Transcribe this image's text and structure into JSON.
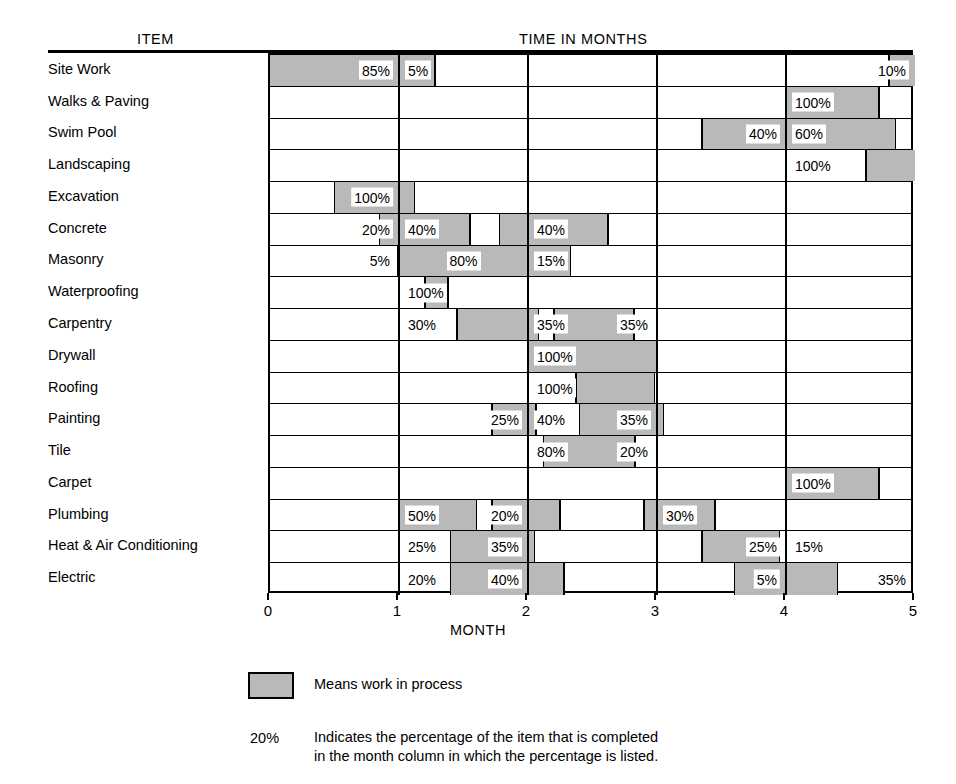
{
  "headers": {
    "item": "ITEM",
    "time": "TIME IN MONTHS",
    "axis_title": "MONTH"
  },
  "legend": {
    "swatch_text": "Means work in process",
    "pct_key": "20%",
    "desc_line1": "Indicates the percentage of the item that is completed",
    "desc_line2": "in the month column in which the percentage is listed."
  },
  "chart_data": {
    "type": "bar",
    "title": "TIME IN MONTHS",
    "subtitle": "Construction Progress Schedule",
    "xlabel": "MONTH",
    "ylabel": "ITEM",
    "xlim": [
      0,
      5
    ],
    "xticks": [
      "0",
      "1",
      "2",
      "3",
      "4",
      "5"
    ],
    "grid": true,
    "legend_position": "below",
    "colors": {
      "work_in_process": "#b9b9b9",
      "idle": "#ffffff",
      "line": "#000000"
    },
    "month_columns": 5,
    "categories": [
      "Site Work",
      "Walks & Paving",
      "Swim Pool",
      "Landscaping",
      "Excavation",
      "Concrete",
      "Masonry",
      "Waterproofing",
      "Carpentry",
      "Drywall",
      "Roofing",
      "Painting",
      "Tile",
      "Carpet",
      "Plumbing",
      "Heat & Air Conditioning",
      "Electric"
    ],
    "rows": [
      {
        "item": "Site Work",
        "bands": [
          [
            0,
            1.28
          ],
          [
            4.8,
            5.0
          ]
        ],
        "labels": [
          {
            "text": "85%",
            "month": 1,
            "align": "right"
          },
          {
            "text": "5%",
            "month": 2,
            "align": "left"
          },
          {
            "text": "10%",
            "month": 5,
            "align": "right"
          }
        ],
        "values": [
          85,
          5,
          0,
          0,
          10
        ]
      },
      {
        "item": "Walks & Paving",
        "bands": [
          [
            4.0,
            4.72
          ]
        ],
        "labels": [
          {
            "text": "100%",
            "month": 5,
            "align": "left"
          }
        ],
        "values": [
          0,
          0,
          0,
          0,
          100
        ]
      },
      {
        "item": "Swim Pool",
        "bands": [
          [
            3.35,
            4.85
          ]
        ],
        "labels": [
          {
            "text": "40%",
            "month": 4,
            "align": "right"
          },
          {
            "text": "60%",
            "month": 5,
            "align": "left"
          }
        ],
        "values": [
          0,
          0,
          0,
          40,
          60
        ]
      },
      {
        "item": "Landscaping",
        "bands": [
          [
            4.62,
            5.0
          ]
        ],
        "labels": [
          {
            "text": "100%",
            "month": 5,
            "align": "left"
          }
        ],
        "values": [
          0,
          0,
          0,
          0,
          100
        ]
      },
      {
        "item": "Excavation",
        "bands": [
          [
            0.5,
            1.12
          ]
        ],
        "labels": [
          {
            "text": "100%",
            "month": 1,
            "align": "right"
          }
        ],
        "values": [
          100,
          0,
          0,
          0,
          0
        ]
      },
      {
        "item": "Concrete",
        "bands": [
          [
            0.85,
            1.55
          ],
          [
            1.78,
            2.62
          ]
        ],
        "labels": [
          {
            "text": "20%",
            "month": 1,
            "align": "right"
          },
          {
            "text": "40%",
            "month": 2,
            "align": "left"
          },
          {
            "text": "40%",
            "month": 3,
            "align": "left"
          }
        ],
        "values": [
          20,
          40,
          40,
          0,
          0
        ]
      },
      {
        "item": "Masonry",
        "bands": [
          [
            0.99,
            2.33
          ]
        ],
        "labels": [
          {
            "text": "5%",
            "month": 1,
            "align": "right"
          },
          {
            "text": "80%",
            "month": 2,
            "align": "center"
          },
          {
            "text": "15%",
            "month": 3,
            "align": "left"
          }
        ],
        "values": [
          5,
          80,
          15,
          0,
          0
        ]
      },
      {
        "item": "Waterproofing",
        "bands": [
          [
            1.2,
            1.38
          ]
        ],
        "labels": [
          {
            "text": "100%",
            "month": 2,
            "align": "left"
          }
        ],
        "values": [
          0,
          100,
          0,
          0,
          0
        ]
      },
      {
        "item": "Carpentry",
        "bands": [
          [
            1.45,
            2.08
          ],
          [
            2.2,
            2.82
          ]
        ],
        "labels": [
          {
            "text": "30%",
            "month": 2,
            "align": "left"
          },
          {
            "text": "35%",
            "month": 3,
            "align": "left"
          },
          {
            "text": "35%",
            "month": 3,
            "align": "right"
          }
        ],
        "values": [
          0,
          30,
          35,
          35,
          0
        ]
      },
      {
        "item": "Drywall",
        "bands": [
          [
            2.0,
            3.0
          ]
        ],
        "labels": [
          {
            "text": "100%",
            "month": 3,
            "align": "left"
          }
        ],
        "values": [
          0,
          0,
          100,
          0,
          0
        ]
      },
      {
        "item": "Roofing",
        "bands": [
          [
            2.37,
            2.98
          ]
        ],
        "labels": [
          {
            "text": "100%",
            "month": 3,
            "align": "left"
          }
        ],
        "values": [
          0,
          0,
          100,
          0,
          0
        ]
      },
      {
        "item": "Painting",
        "bands": [
          [
            1.72,
            2.06
          ],
          [
            2.4,
            3.05
          ]
        ],
        "labels": [
          {
            "text": "25%",
            "month": 2,
            "align": "right"
          },
          {
            "text": "40%",
            "month": 3,
            "align": "left"
          },
          {
            "text": "35%",
            "month": 3,
            "align": "right"
          }
        ],
        "values": [
          0,
          25,
          40,
          35,
          0
        ]
      },
      {
        "item": "Tile",
        "bands": [
          [
            2.12,
            2.83
          ]
        ],
        "labels": [
          {
            "text": "80%",
            "month": 3,
            "align": "left"
          },
          {
            "text": "20%",
            "month": 3,
            "align": "right"
          }
        ],
        "values": [
          0,
          0,
          80,
          20,
          0
        ]
      },
      {
        "item": "Carpet",
        "bands": [
          [
            4.0,
            4.72
          ]
        ],
        "labels": [
          {
            "text": "100%",
            "month": 5,
            "align": "left"
          }
        ],
        "values": [
          0,
          0,
          0,
          0,
          100
        ]
      },
      {
        "item": "Plumbing",
        "bands": [
          [
            1.0,
            1.6
          ],
          [
            1.72,
            2.25
          ],
          [
            2.9,
            3.45
          ]
        ],
        "labels": [
          {
            "text": "50%",
            "month": 2,
            "align": "left"
          },
          {
            "text": "20%",
            "month": 2,
            "align": "right"
          },
          {
            "text": "30%",
            "month": 4,
            "align": "left"
          }
        ],
        "values": [
          0,
          50,
          20,
          30,
          0
        ]
      },
      {
        "item": "Heat & Air Conditioning",
        "bands": [
          [
            1.4,
            2.05
          ],
          [
            3.35,
            3.95
          ]
        ],
        "labels": [
          {
            "text": "25%",
            "month": 2,
            "align": "left"
          },
          {
            "text": "35%",
            "month": 2,
            "align": "right"
          },
          {
            "text": "25%",
            "month": 4,
            "align": "right"
          },
          {
            "text": "15%",
            "month": 5,
            "align": "left"
          }
        ],
        "values": [
          0,
          25,
          35,
          25,
          15
        ]
      },
      {
        "item": "Electric",
        "bands": [
          [
            1.4,
            2.28
          ],
          [
            3.6,
            4.4
          ]
        ],
        "labels": [
          {
            "text": "20%",
            "month": 2,
            "align": "left"
          },
          {
            "text": "40%",
            "month": 2,
            "align": "right"
          },
          {
            "text": "5%",
            "month": 4,
            "align": "right"
          },
          {
            "text": "35%",
            "month": 5,
            "align": "right"
          }
        ],
        "values": [
          0,
          20,
          40,
          5,
          35
        ]
      }
    ]
  }
}
